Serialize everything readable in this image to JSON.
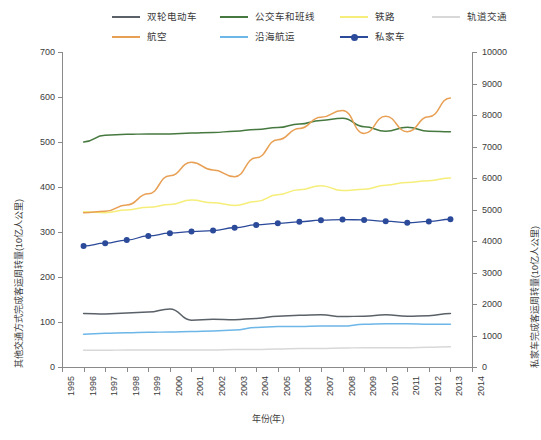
{
  "chart_data": {
    "type": "line",
    "title": "",
    "xlabel": "年份(年)",
    "ylabel": "其他交通方式完成客运周转量(10亿人公里)",
    "ylabel_right": "私家车完成客运周转量(10亿人公里)",
    "xlim": [
      1995,
      2014
    ],
    "ylim": [
      0,
      700
    ],
    "ylim_right": [
      0,
      10000
    ],
    "grid": false,
    "legend_position": "top",
    "x_ticks": [
      "1995",
      "1996",
      "1997",
      "1998",
      "1999",
      "2000",
      "2001",
      "2002",
      "2003",
      "2004",
      "2005",
      "2006",
      "2007",
      "2008",
      "2009",
      "2010",
      "2011",
      "2012",
      "2013",
      "2014"
    ],
    "y_ticks_left": [
      "0",
      "100",
      "200",
      "300",
      "400",
      "500",
      "600",
      "700"
    ],
    "y_ticks_right": [
      "0",
      "1000",
      "2000",
      "3000",
      "4000",
      "5000",
      "6000",
      "7000",
      "8000",
      "9000",
      "10000"
    ],
    "x": [
      1996,
      1997,
      1998,
      1999,
      2000,
      2001,
      2002,
      2003,
      2004,
      2005,
      2006,
      2007,
      2008,
      2009,
      2010,
      2011,
      2012,
      2013
    ],
    "series": [
      {
        "name": "双轮电动车",
        "color": "#5a6168",
        "axis": "left",
        "marker": false,
        "values": [
          119,
          118,
          120,
          122,
          129,
          104,
          106,
          105,
          108,
          113,
          115,
          116,
          112,
          113,
          116,
          113,
          114,
          119
        ]
      },
      {
        "name": "公交车和班线",
        "color": "#46793f",
        "axis": "left",
        "marker": false,
        "values": [
          500,
          515,
          517,
          518,
          518,
          520,
          521,
          524,
          528,
          532,
          540,
          548,
          553,
          534,
          524,
          533,
          524,
          523
        ]
      },
      {
        "name": "铁路",
        "color": "#f5ee7a",
        "axis": "left",
        "marker": false,
        "values": [
          345,
          343,
          349,
          355,
          361,
          371,
          365,
          359,
          368,
          383,
          394,
          403,
          392,
          395,
          404,
          410,
          414,
          420
        ]
      },
      {
        "name": "轨道交通",
        "color": "#d8d8d8",
        "axis": "left",
        "marker": false,
        "values": [
          37,
          37,
          38,
          38,
          38,
          38,
          38,
          39,
          39,
          40,
          41,
          41,
          42,
          43,
          43,
          43,
          44,
          45
        ]
      },
      {
        "name": "航空",
        "color": "#e8a055",
        "axis": "left",
        "marker": false,
        "values": [
          343,
          346,
          360,
          385,
          425,
          455,
          438,
          423,
          465,
          505,
          530,
          555,
          570,
          519,
          557,
          523,
          556,
          598
        ]
      },
      {
        "name": "沿海航运",
        "color": "#6cb6e8",
        "axis": "left",
        "marker": false,
        "values": [
          73,
          75,
          76,
          77,
          78,
          79,
          80,
          82,
          88,
          90,
          90,
          91,
          91,
          95,
          96,
          96,
          95,
          95
        ]
      },
      {
        "name": "私家车",
        "color": "#2c4a9a",
        "axis": "right",
        "marker": true,
        "values": [
          3840,
          3930,
          4030,
          4160,
          4250,
          4300,
          4330,
          4420,
          4510,
          4560,
          4610,
          4660,
          4680,
          4670,
          4630,
          4580,
          4620,
          4690
        ]
      }
    ]
  },
  "legend": {
    "row1": [
      {
        "label": "双轮电动车",
        "color": "#5a6168",
        "marker": false
      },
      {
        "label": "公交车和班线",
        "color": "#46793f",
        "marker": false
      },
      {
        "label": "铁路",
        "color": "#f5ee7a",
        "marker": false
      },
      {
        "label": "轨道交通",
        "color": "#d8d8d8",
        "marker": false
      }
    ],
    "row2": [
      {
        "label": "航空",
        "color": "#e8a055",
        "marker": false
      },
      {
        "label": "沿海航运",
        "color": "#6cb6e8",
        "marker": false
      },
      {
        "label": "私家车",
        "color": "#2c4a9a",
        "marker": true
      }
    ]
  },
  "caption": ""
}
